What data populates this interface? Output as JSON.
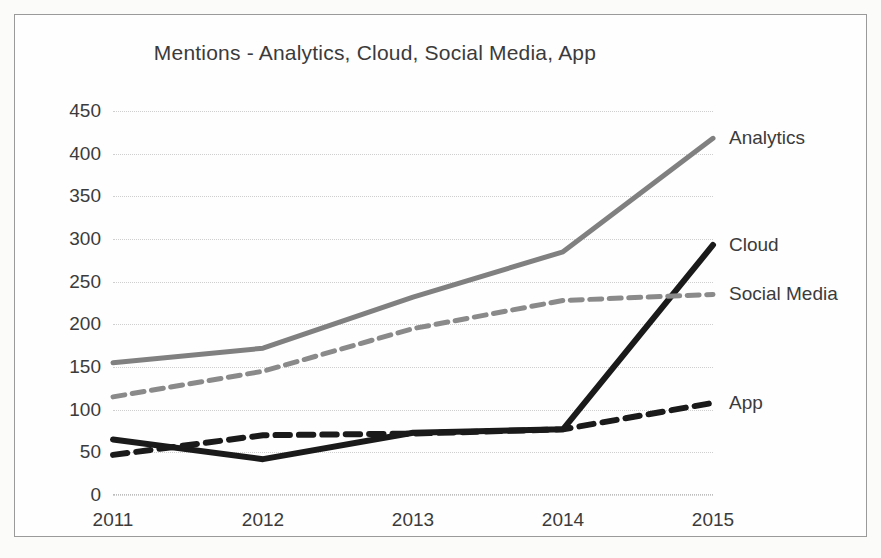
{
  "chart_data": {
    "type": "line",
    "title": "Mentions - Analytics, Cloud, Social Media, App",
    "xlabel": "",
    "ylabel": "",
    "categories": [
      "2011",
      "2012",
      "2013",
      "2014",
      "2015"
    ],
    "ylim": [
      0,
      450
    ],
    "ytick_step": 50,
    "yticks": [
      "450",
      "400",
      "350",
      "300",
      "250",
      "200",
      "150",
      "100",
      "50",
      "0"
    ],
    "grid": true,
    "legend_position": "right-inline-labels",
    "series": [
      {
        "name": "Analytics",
        "values": [
          155,
          172,
          232,
          285,
          418
        ],
        "color": "#808080",
        "style": "solid",
        "width": 5
      },
      {
        "name": "Cloud",
        "values": [
          65,
          42,
          73,
          77,
          293
        ],
        "color": "#1a1a1a",
        "style": "solid",
        "width": 6
      },
      {
        "name": "Social Media",
        "values": [
          115,
          145,
          195,
          228,
          235
        ],
        "color": "#8a8a8a",
        "style": "dashed",
        "width": 5
      },
      {
        "name": "App",
        "values": [
          47,
          70,
          72,
          77,
          108
        ],
        "color": "#1a1a1a",
        "style": "dashed",
        "width": 6
      }
    ]
  },
  "figure": {
    "background": "#fefefe",
    "page_background": "#fbfbfa",
    "border_color": "#9a9a9a",
    "gridline_color": "#cfcfcf"
  }
}
